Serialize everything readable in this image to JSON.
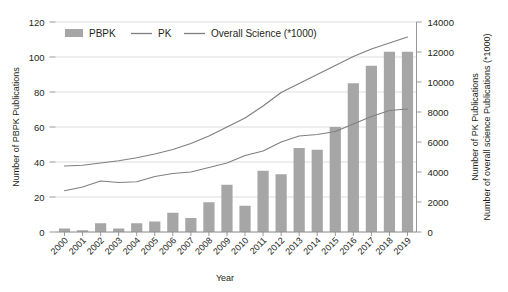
{
  "chart_data": {
    "type": "bar",
    "title": "",
    "xlabel": "Year",
    "ylabel": "Number of PBPK Publications",
    "y2label_line1": "Number of PK Publications",
    "y2label_line2": "Number of overall science Publications (*1000)",
    "grid": true,
    "legend_position": "top-left-inside",
    "categories": [
      "2000",
      "2001",
      "2002",
      "2003",
      "2004",
      "2005",
      "2006",
      "2007",
      "2008",
      "2009",
      "2010",
      "2011",
      "2012",
      "2013",
      "2014",
      "2015",
      "2016",
      "2017",
      "2018",
      "2019"
    ],
    "ylim": [
      0,
      120
    ],
    "yticks": [
      0,
      20,
      40,
      60,
      80,
      100,
      120
    ],
    "ytick_labels": [
      "0",
      "20",
      "40",
      "60",
      "80",
      "100",
      "120"
    ],
    "y2lim": [
      0,
      14000
    ],
    "y2ticks": [
      0,
      2000,
      4000,
      6000,
      8000,
      10000,
      12000,
      14000
    ],
    "y2tick_labels": [
      "0",
      "2000",
      "4000",
      "6000",
      "8000",
      "10000",
      "12000",
      "14000"
    ],
    "series": [
      {
        "name": "PBPK",
        "type": "bar",
        "axis": "left",
        "color": "#a6a6a6",
        "values": [
          2,
          1,
          5,
          2,
          5,
          6,
          11,
          8,
          17,
          27,
          15,
          35,
          33,
          48,
          47,
          60,
          85,
          95,
          103,
          103
        ]
      },
      {
        "name": "PK",
        "type": "line",
        "axis": "right",
        "color": "#808080",
        "values": [
          2750,
          3000,
          3400,
          3300,
          3350,
          3700,
          3900,
          4000,
          4300,
          4600,
          5100,
          5400,
          6000,
          6400,
          6500,
          6700,
          7200,
          7700,
          8100,
          8200
        ]
      },
      {
        "name": "Overall Science (*1000)",
        "type": "line",
        "axis": "right",
        "color": "#808080",
        "values": [
          4400,
          4450,
          4600,
          4750,
          4950,
          5200,
          5500,
          5900,
          6400,
          7000,
          7600,
          8400,
          9300,
          9900,
          10500,
          11100,
          11700,
          12200,
          12600,
          13000
        ]
      }
    ],
    "legend": [
      {
        "label": "PBPK",
        "marker": "swatch"
      },
      {
        "label": "PK",
        "marker": "line"
      },
      {
        "label": "Overall Science (*1000)",
        "marker": "line"
      }
    ]
  }
}
